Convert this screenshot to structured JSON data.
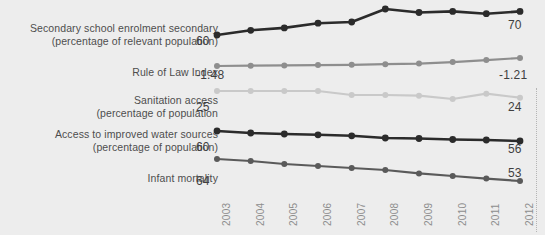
{
  "chart_data": {
    "type": "line",
    "title": "",
    "subtitle": "",
    "xlabel": "",
    "ylabel": "",
    "grid": false,
    "legend_position": "left-labels",
    "x": [
      "2003",
      "2004",
      "2005",
      "2006",
      "2007",
      "2008",
      "2009",
      "2010",
      "2011",
      "2012"
    ],
    "categories": [
      "2003",
      "2004",
      "2005",
      "2006",
      "2007",
      "2008",
      "2009",
      "2010",
      "2011",
      "2012"
    ],
    "series": [
      {
        "name": "Secondary school enrolment secondary (percentage of relevant population)",
        "label_line1": "Secondary school enrolment secondary",
        "label_line2": "(percentage of relevant population)",
        "color": "#2b2b2b",
        "start_value": "60",
        "end_value": "70",
        "values": [
          60,
          62,
          63,
          65,
          65.5,
          71,
          69.5,
          70,
          69,
          70
        ]
      },
      {
        "name": "Rule of Law Index",
        "label_line1": "Rule of Law Index",
        "label_line2": "",
        "color": "#8e8e8e",
        "start_value": "-1.48",
        "end_value": "-1.21",
        "values": [
          -1.48,
          -1.47,
          -1.46,
          -1.45,
          -1.44,
          -1.42,
          -1.4,
          -1.35,
          -1.28,
          -1.21
        ]
      },
      {
        "name": "Sanitation access (percentage of population",
        "label_line1": "Sanitation access",
        "label_line2": "(percentage of population",
        "color": "#c9c9c9",
        "start_value": "25",
        "end_value": "24",
        "values": [
          25,
          25,
          25,
          25,
          24.4,
          24.4,
          24.3,
          23.8,
          24.6,
          24
        ]
      },
      {
        "name": "Access to improved water sources (percentage of population)",
        "label_line1": "Access to improved water sources",
        "label_line2": "(percentage of population)",
        "color": "#2b2b2b",
        "start_value": "60",
        "end_value": "56",
        "values": [
          60,
          59.2,
          58.8,
          58.5,
          58.1,
          57.2,
          57.0,
          56.6,
          56.4,
          56
        ]
      },
      {
        "name": "Infant mortality",
        "label_line1": "Infant mortality",
        "label_line2": "",
        "color": "#5a5a5a",
        "start_value": "64",
        "end_value": "53",
        "values": [
          64,
          63,
          61.5,
          60.5,
          59.5,
          58.5,
          56.8,
          55.5,
          54.2,
          53
        ]
      }
    ]
  },
  "axis": {
    "years": [
      "2003",
      "2004",
      "2005",
      "2006",
      "2007",
      "2008",
      "2009",
      "2010",
      "2011",
      "2012"
    ]
  },
  "colors": {
    "background": "#ededed",
    "dark": "#2b2b2b",
    "mid": "#8e8e8e",
    "light": "#c9c9c9",
    "text": "#4d4d4d",
    "tick": "#8d8d8d"
  }
}
